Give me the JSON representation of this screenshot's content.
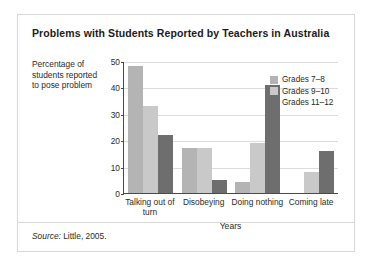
{
  "chart_data": {
    "type": "bar",
    "title": "Problems with Students Reported by Teachers in Australia",
    "categories": [
      "Talking out of turn",
      "Disobeying",
      "Doing nothing",
      "Coming late"
    ],
    "series": [
      {
        "name": "Grades 7–8",
        "color": "#b4b4b4",
        "values": [
          48,
          17,
          4,
          0
        ]
      },
      {
        "name": "Grades 9–10",
        "color": "#c9c9c9",
        "values": [
          33,
          17,
          19,
          8
        ]
      },
      {
        "name": "Grades 11–12",
        "color": "#6e6e6e",
        "values": [
          22,
          5,
          41,
          16
        ]
      }
    ],
    "xlabel": "Years",
    "ylabel": "Percentage of students reported to pose problem",
    "ylim": [
      0,
      50
    ],
    "yticks": [
      0,
      10,
      20,
      30,
      40,
      50
    ],
    "grid": true,
    "legend_position": "top-right"
  },
  "source": {
    "lead": "Source:",
    "text": " Little, 2005."
  }
}
